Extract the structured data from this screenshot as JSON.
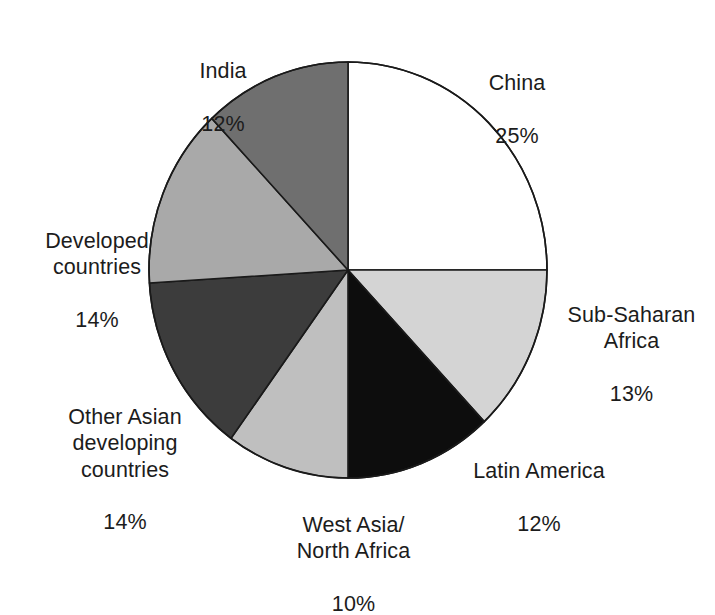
{
  "chart_data": {
    "type": "pie",
    "title": "",
    "subtitle": "",
    "xlabel": "",
    "ylabel": "",
    "legend_position": "none",
    "grid": false,
    "units": "percent",
    "total": 100,
    "start_angle_deg": 0,
    "direction": "clockwise",
    "categories": [
      "China",
      "Sub-Saharan Africa",
      "Latin America",
      "West Asia/ North Africa",
      "Other Asian developing countries",
      "Developed countries",
      "India"
    ],
    "values": [
      25,
      13,
      12,
      10,
      14,
      14,
      12
    ],
    "colors": [
      "#ffffff",
      "#d4d4d4",
      "#0d0d0d",
      "#bfbfbf",
      "#3c3c3c",
      "#a9a9a9",
      "#6f6f6f"
    ],
    "slices": [
      {
        "key": "china",
        "name": "China",
        "value": 25,
        "percent_label": "25%",
        "color": "#ffffff",
        "label_lines": [
          "China",
          "25%"
        ]
      },
      {
        "key": "sub-saharan-africa",
        "name": "Sub-Saharan Africa",
        "value": 13,
        "percent_label": "13%",
        "color": "#d4d4d4",
        "label_lines": [
          "Sub-Saharan",
          "Africa",
          "13%"
        ]
      },
      {
        "key": "latin-america",
        "name": "Latin America",
        "value": 12,
        "percent_label": "12%",
        "color": "#0d0d0d",
        "label_lines": [
          "Latin America",
          "12%"
        ]
      },
      {
        "key": "west-asia-north-africa",
        "name": "West Asia/ North Africa",
        "value": 10,
        "percent_label": "10%",
        "color": "#bfbfbf",
        "label_lines": [
          "West Asia/",
          "North Africa",
          "10%"
        ]
      },
      {
        "key": "other-asian-developing-countries",
        "name": "Other Asian developing countries",
        "value": 14,
        "percent_label": "14%",
        "color": "#3c3c3c",
        "label_lines": [
          "Other Asian",
          "developing",
          "countries",
          "14%"
        ]
      },
      {
        "key": "developed-countries",
        "name": "Developed countries",
        "value": 14,
        "percent_label": "14%",
        "color": "#a9a9a9",
        "label_lines": [
          "Developed",
          "countries",
          "14%"
        ]
      },
      {
        "key": "india",
        "name": "India",
        "value": 12,
        "percent_label": "12%",
        "color": "#6f6f6f",
        "label_lines": [
          "India",
          "12%"
        ]
      }
    ]
  },
  "labels": {
    "china": {
      "name": "China",
      "pct": "25%"
    },
    "subsaharan": {
      "name": "Sub-Saharan\nAfrica",
      "pct": "13%"
    },
    "latin": {
      "name": "Latin America",
      "pct": "12%"
    },
    "westasia": {
      "name": "West Asia/\nNorth Africa",
      "pct": "10%"
    },
    "otherasian": {
      "name": "Other Asian\ndeveloping\ncountries",
      "pct": "14%"
    },
    "developed": {
      "name": "Developed\ncountries",
      "pct": "14%"
    },
    "india": {
      "name": "India",
      "pct": "12%"
    }
  },
  "geometry": {
    "center_x": 348,
    "center_y": 270,
    "radius_x": 199,
    "radius_y": 208,
    "stroke": "#1a1a1a",
    "stroke_width": 1.6
  }
}
